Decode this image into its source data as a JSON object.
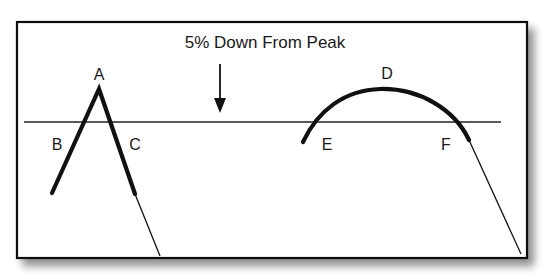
{
  "diagram": {
    "title": "5% Down From Peak",
    "labels": {
      "A": "A",
      "B": "B",
      "C": "C",
      "D": "D",
      "E": "E",
      "F": "F"
    },
    "colors": {
      "stroke": "#111111",
      "frame": "#111111",
      "background": "#ffffff",
      "shadow": "#9a9a9a"
    }
  }
}
